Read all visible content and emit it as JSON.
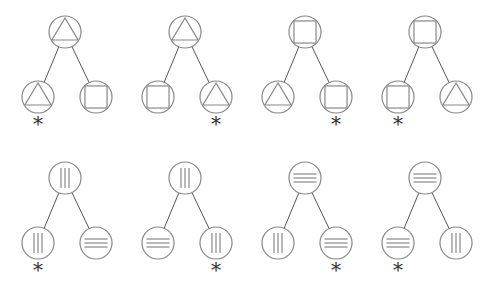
{
  "diagram": {
    "title": "",
    "stroke_color": "#888888",
    "edge_color": "#555555",
    "background": "#ffffff",
    "marker_symbol": "*",
    "layout": {
      "tree_spacing_x": 120,
      "first_tree_root_x": 65,
      "row_root_y": [
        32,
        178
      ],
      "child_offset_x": [
        -27,
        31
      ],
      "child_offset_y": 65,
      "node_radius": 16,
      "asterisk_offset_y": 20
    },
    "rows": [
      {
        "trees": [
          {
            "root": "triangle",
            "children": [
              "triangle",
              "square"
            ],
            "marked_child": 0
          },
          {
            "root": "triangle",
            "children": [
              "square",
              "triangle"
            ],
            "marked_child": 1
          },
          {
            "root": "square",
            "children": [
              "triangle",
              "square"
            ],
            "marked_child": 1
          },
          {
            "root": "square",
            "children": [
              "square",
              "triangle"
            ],
            "marked_child": 0
          }
        ]
      },
      {
        "trees": [
          {
            "root": "vertical-lines",
            "children": [
              "vertical-lines",
              "horizontal-lines"
            ],
            "marked_child": 0
          },
          {
            "root": "vertical-lines",
            "children": [
              "horizontal-lines",
              "vertical-lines"
            ],
            "marked_child": 1
          },
          {
            "root": "horizontal-lines",
            "children": [
              "vertical-lines",
              "horizontal-lines"
            ],
            "marked_child": 1
          },
          {
            "root": "horizontal-lines",
            "children": [
              "horizontal-lines",
              "vertical-lines"
            ],
            "marked_child": 0
          }
        ]
      }
    ]
  }
}
